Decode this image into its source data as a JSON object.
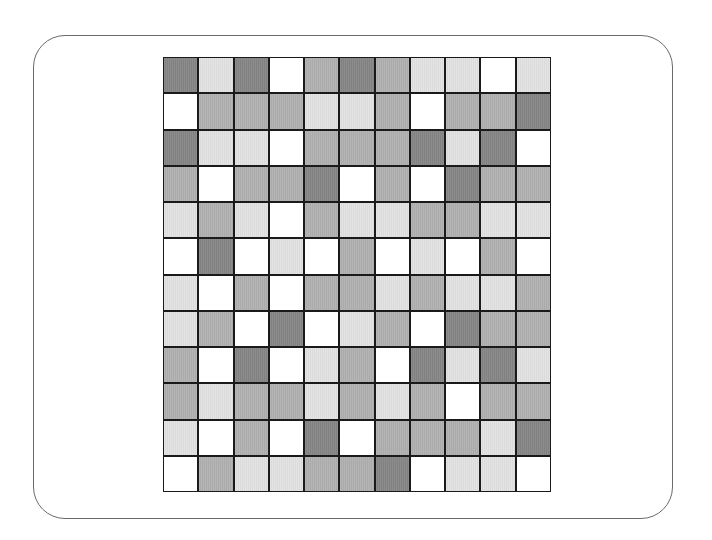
{
  "board": {
    "columns": 11,
    "rows": 12,
    "shade_legend": {
      "D": {
        "name": "dark",
        "color": "#858585"
      },
      "M": {
        "name": "medium",
        "color": "#b0b0b0"
      },
      "L": {
        "name": "light",
        "color": "#e2e2e2"
      },
      "W": {
        "name": "white",
        "color": "#ffffff"
      }
    },
    "grid": [
      [
        "D",
        "L",
        "D",
        "W",
        "M",
        "D",
        "M",
        "L",
        "L",
        "W",
        "L"
      ],
      [
        "W",
        "M",
        "M",
        "M",
        "L",
        "L",
        "M",
        "W",
        "M",
        "M",
        "D"
      ],
      [
        "D",
        "L",
        "L",
        "W",
        "M",
        "M",
        "M",
        "D",
        "L",
        "D",
        "W"
      ],
      [
        "M",
        "W",
        "M",
        "M",
        "D",
        "W",
        "M",
        "W",
        "D",
        "M",
        "M"
      ],
      [
        "L",
        "M",
        "L",
        "W",
        "M",
        "L",
        "L",
        "M",
        "M",
        "L",
        "L"
      ],
      [
        "W",
        "D",
        "W",
        "L",
        "W",
        "M",
        "W",
        "L",
        "W",
        "M",
        "W"
      ],
      [
        "L",
        "W",
        "M",
        "W",
        "M",
        "M",
        "L",
        "M",
        "L",
        "L",
        "M"
      ],
      [
        "L",
        "M",
        "W",
        "D",
        "W",
        "L",
        "M",
        "W",
        "D",
        "M",
        "M"
      ],
      [
        "M",
        "W",
        "D",
        "W",
        "L",
        "M",
        "W",
        "D",
        "L",
        "D",
        "L"
      ],
      [
        "M",
        "L",
        "M",
        "M",
        "L",
        "M",
        "L",
        "M",
        "W",
        "M",
        "M"
      ],
      [
        "L",
        "W",
        "M",
        "W",
        "D",
        "W",
        "M",
        "M",
        "M",
        "L",
        "D"
      ],
      [
        "W",
        "M",
        "L",
        "L",
        "M",
        "M",
        "D",
        "W",
        "L",
        "L",
        "W"
      ]
    ]
  },
  "colors": {
    "frame_border": "#6a6a6a",
    "grid_line": "#1a1a1a",
    "background": "#ffffff"
  }
}
